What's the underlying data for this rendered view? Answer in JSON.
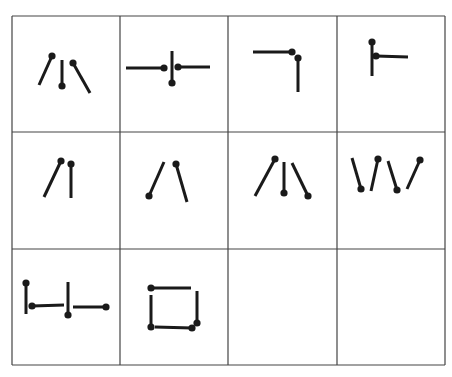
{
  "grid": {
    "rows": 3,
    "cols": 4,
    "col_lines": [
      12,
      120,
      228,
      337,
      445
    ],
    "row_lines": [
      16,
      132,
      249,
      365
    ],
    "line_color": "#444444",
    "stroke_color": "#1a1a1a"
  },
  "cells": [
    {
      "id": "r1c1",
      "sticks": [
        [
          39,
          85,
          52,
          56,
          "head-end"
        ],
        [
          62,
          60,
          62,
          86,
          "head-end"
        ],
        [
          73,
          63,
          90,
          93,
          "head-start"
        ]
      ]
    },
    {
      "id": "r1c2",
      "sticks": [
        [
          126,
          68,
          164,
          68,
          "head-end"
        ],
        [
          172,
          51,
          172,
          83,
          "head-end"
        ],
        [
          178,
          67,
          210,
          67,
          "head-start"
        ]
      ]
    },
    {
      "id": "r1c3",
      "sticks": [
        [
          253,
          52,
          292,
          52,
          "head-end"
        ],
        [
          298,
          58,
          298,
          92,
          "head-start"
        ]
      ]
    },
    {
      "id": "r1c4",
      "sticks": [
        [
          372,
          42,
          372,
          76,
          "head-start"
        ],
        [
          376,
          56,
          408,
          57,
          "head-start"
        ]
      ]
    },
    {
      "id": "r2c1",
      "sticks": [
        [
          44,
          197,
          61,
          161,
          "head-end"
        ],
        [
          71,
          164,
          71,
          198,
          "head-start"
        ]
      ]
    },
    {
      "id": "r2c2",
      "sticks": [
        [
          149,
          196,
          164,
          162,
          "head-start"
        ],
        [
          176,
          164,
          187,
          202,
          "head-start"
        ]
      ]
    },
    {
      "id": "r2c3",
      "sticks": [
        [
          255,
          196,
          275,
          159,
          "head-end"
        ],
        [
          284,
          162,
          284,
          193,
          "head-end"
        ],
        [
          292,
          163,
          308,
          196,
          "head-end"
        ]
      ]
    },
    {
      "id": "r2c4",
      "sticks": [
        [
          352,
          158,
          361,
          189,
          "head-end"
        ],
        [
          371,
          191,
          378,
          159,
          "head-end"
        ],
        [
          388,
          161,
          397,
          190,
          "head-end"
        ],
        [
          407,
          189,
          420,
          160,
          "head-end"
        ]
      ]
    },
    {
      "id": "r3c1",
      "sticks": [
        [
          26,
          283,
          26,
          314,
          "head-start"
        ],
        [
          32,
          306,
          64,
          305,
          "head-start"
        ],
        [
          68,
          282,
          68,
          315,
          "head-end"
        ],
        [
          73,
          307,
          106,
          307,
          "head-end"
        ]
      ]
    },
    {
      "id": "r3c2",
      "sticks": [
        [
          151,
          288,
          191,
          288,
          "head-start"
        ],
        [
          151,
          295,
          151,
          327,
          "head-end"
        ],
        [
          155,
          327,
          192,
          328,
          "head-end"
        ],
        [
          197,
          291,
          197,
          323,
          "head-end"
        ]
      ]
    },
    {
      "id": "r3c3",
      "sticks": []
    },
    {
      "id": "r3c4",
      "sticks": []
    }
  ]
}
